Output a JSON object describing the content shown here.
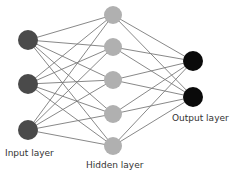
{
  "diagram": {
    "colors": {
      "input": "#4a4a4a",
      "hidden": "#b0b0b0",
      "output": "#0a0a0a",
      "edge": "#7a7a7a"
    },
    "layers": [
      {
        "name": "input",
        "label": "Input layer",
        "nodes": [
          [
            28,
            40
          ],
          [
            28,
            84
          ],
          [
            28,
            130
          ]
        ],
        "r": 10
      },
      {
        "name": "hidden",
        "label": "Hidden layer",
        "nodes": [
          [
            113,
            15
          ],
          [
            113,
            47
          ],
          [
            113,
            80
          ],
          [
            113,
            114
          ],
          [
            113,
            146
          ]
        ],
        "r": 9
      },
      {
        "name": "output",
        "label": "Output layer",
        "nodes": [
          [
            193,
            61
          ],
          [
            193,
            97
          ]
        ],
        "r": 10
      }
    ]
  },
  "labels": {
    "input": "Input layer",
    "hidden": "Hidden layer",
    "output": "Output layer"
  }
}
